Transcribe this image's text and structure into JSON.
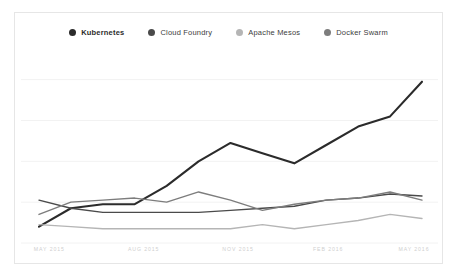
{
  "card": {
    "background": "#ffffff",
    "border_color": "#e6e6e6"
  },
  "legend": {
    "position": "top-center",
    "items": [
      {
        "label": "Kubernetes",
        "color": "#2b2b2b",
        "dot": "legend-dot-kubernetes"
      },
      {
        "label": "Cloud Foundry",
        "color": "#4a4a4a",
        "dot": "legend-dot-cloud-foundry"
      },
      {
        "label": "Apache Mesos",
        "color": "#b5b5b5",
        "dot": "legend-dot-apache-mesos"
      },
      {
        "label": "Docker Swarm",
        "color": "#7d7d7d",
        "dot": "legend-dot-docker-swarm"
      }
    ]
  },
  "chart_data": {
    "type": "line",
    "title": "",
    "subtitle": "",
    "xlabel": "",
    "ylabel": "",
    "grid": true,
    "gridlines_y": [
      0,
      20,
      40,
      60,
      80
    ],
    "legend_position": "top-center",
    "ylim": [
      0,
      95
    ],
    "xlim": [
      0,
      12
    ],
    "x": [
      "MAY 2015",
      "JUN 2015",
      "JUL 2015",
      "AUG 2015",
      "SEP 2015",
      "OCT 2015",
      "NOV 2015",
      "DEC 2015",
      "JAN 2016",
      "FEB 2016",
      "MAR 2016",
      "APR 2016",
      "MAY 2016"
    ],
    "tick_labels": [
      "MAY 2015",
      "AUG 2015",
      "NOV 2015",
      "FEB 2016",
      "MAY 2016"
    ],
    "tick_indices": [
      0,
      3,
      6,
      9,
      12
    ],
    "series": [
      {
        "name": "Kubernetes",
        "color": "#2b2b2b",
        "values": [
          8,
          17,
          19,
          19,
          28,
          40,
          49,
          44,
          39,
          48,
          57,
          62,
          79
        ]
      },
      {
        "name": "Cloud Foundry",
        "color": "#4a4a4a",
        "values": [
          21,
          17,
          15,
          15,
          15,
          15,
          16,
          17,
          18,
          21,
          22,
          24,
          23
        ]
      },
      {
        "name": "Apache Mesos",
        "color": "#b5b5b5",
        "values": [
          9,
          8,
          7,
          7,
          7,
          7,
          7,
          9,
          7,
          9,
          11,
          14,
          12
        ]
      },
      {
        "name": "Docker Swarm",
        "color": "#7d7d7d",
        "values": [
          14,
          20,
          21,
          22,
          20,
          25,
          21,
          16,
          19,
          21,
          22,
          25,
          21
        ]
      }
    ]
  },
  "xaxis": {
    "tick_color": "#cfcfcf",
    "ticks": [
      {
        "label": "MAY 2015",
        "pct": 8
      },
      {
        "label": "AUG 2015",
        "pct": 30
      },
      {
        "label": "NOV 2015",
        "pct": 52
      },
      {
        "label": "FEB 2016",
        "pct": 73
      },
      {
        "label": "MAY 2016",
        "pct": 93
      }
    ]
  }
}
